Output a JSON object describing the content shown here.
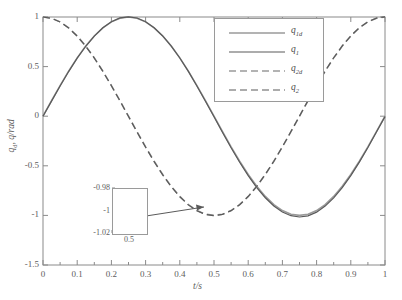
{
  "chart_data": {
    "type": "line",
    "title": "",
    "xlabel": "t/s",
    "ylabel": "q_d, q/rad",
    "xlim": [
      0,
      1
    ],
    "ylim": [
      -1.5,
      1
    ],
    "xticks": [
      "0",
      "0.1",
      "0.2",
      "0.3",
      "0.4",
      "0.5",
      "0.6",
      "0.7",
      "0.8",
      "0.9",
      "1"
    ],
    "xtick_values": [
      0,
      0.1,
      0.2,
      0.3,
      0.4,
      0.5,
      0.6,
      0.7,
      0.8,
      0.9,
      1
    ],
    "yticks": [
      "1",
      "0.5",
      "0",
      "-0.5",
      "-1",
      "-1.5"
    ],
    "ytick_values": [
      1,
      0.5,
      0,
      -0.5,
      -1,
      -1.5
    ],
    "grid": false,
    "legend_position": "upper-right",
    "series": [
      {
        "name": "q_1d",
        "label_main": "q",
        "label_sub": "1d",
        "style": "solid",
        "color": "#9a9a9a",
        "width": 1.6,
        "x": [
          0,
          0.025,
          0.05,
          0.075,
          0.1,
          0.125,
          0.15,
          0.175,
          0.2,
          0.225,
          0.25,
          0.275,
          0.3,
          0.325,
          0.35,
          0.375,
          0.4,
          0.425,
          0.45,
          0.475,
          0.5,
          0.525,
          0.55,
          0.575,
          0.6,
          0.625,
          0.65,
          0.675,
          0.7,
          0.725,
          0.75,
          0.775,
          0.8,
          0.825,
          0.85,
          0.875,
          0.9,
          0.925,
          0.95,
          0.975,
          1
        ],
        "values": [
          0,
          0.156,
          0.309,
          0.454,
          0.588,
          0.707,
          0.809,
          0.891,
          0.951,
          0.988,
          1,
          0.988,
          0.951,
          0.891,
          0.809,
          0.707,
          0.588,
          0.454,
          0.309,
          0.156,
          0,
          -0.156,
          -0.309,
          -0.454,
          -0.588,
          -0.707,
          -0.809,
          -0.891,
          -0.951,
          -0.988,
          -1,
          -0.988,
          -0.951,
          -0.891,
          -0.809,
          -0.707,
          -0.588,
          -0.454,
          -0.309,
          -0.156,
          0
        ]
      },
      {
        "name": "q_1",
        "label_main": "q",
        "label_sub": "1",
        "style": "solid",
        "color": "#5a5a5a",
        "width": 1.2,
        "x": [
          0,
          0.025,
          0.05,
          0.075,
          0.1,
          0.125,
          0.15,
          0.175,
          0.2,
          0.225,
          0.25,
          0.275,
          0.3,
          0.325,
          0.35,
          0.375,
          0.4,
          0.425,
          0.45,
          0.475,
          0.5,
          0.525,
          0.55,
          0.575,
          0.6,
          0.625,
          0.65,
          0.675,
          0.7,
          0.725,
          0.75,
          0.775,
          0.8,
          0.825,
          0.85,
          0.875,
          0.9,
          0.925,
          0.95,
          0.975,
          1
        ],
        "values": [
          0,
          0.152,
          0.304,
          0.45,
          0.585,
          0.705,
          0.808,
          0.892,
          0.953,
          0.991,
          1.002,
          0.99,
          0.953,
          0.892,
          0.809,
          0.707,
          0.587,
          0.452,
          0.305,
          0.151,
          -0.006,
          -0.164,
          -0.318,
          -0.464,
          -0.599,
          -0.719,
          -0.822,
          -0.905,
          -0.966,
          -1.003,
          -1.016,
          -1.004,
          -0.967,
          -0.906,
          -0.823,
          -0.72,
          -0.599,
          -0.463,
          -0.316,
          -0.16,
          -0.004
        ]
      },
      {
        "name": "q_2d",
        "label_main": "q",
        "label_sub": "2d",
        "style": "dashed",
        "color": "#9a9a9a",
        "width": 1.6,
        "x": [
          0,
          0.025,
          0.05,
          0.075,
          0.1,
          0.125,
          0.15,
          0.175,
          0.2,
          0.225,
          0.25,
          0.275,
          0.3,
          0.325,
          0.35,
          0.375,
          0.4,
          0.425,
          0.45,
          0.475,
          0.5,
          0.525,
          0.55,
          0.575,
          0.6,
          0.625,
          0.65,
          0.675,
          0.7,
          0.725,
          0.75,
          0.775,
          0.8,
          0.825,
          0.85,
          0.875,
          0.9,
          0.925,
          0.95,
          0.975,
          1
        ],
        "values": [
          1,
          0.988,
          0.951,
          0.891,
          0.809,
          0.707,
          0.588,
          0.454,
          0.309,
          0.156,
          0,
          -0.156,
          -0.309,
          -0.454,
          -0.588,
          -0.707,
          -0.809,
          -0.891,
          -0.951,
          -0.988,
          -1,
          -0.988,
          -0.951,
          -0.891,
          -0.809,
          -0.707,
          -0.588,
          -0.454,
          -0.309,
          -0.156,
          0,
          0.156,
          0.309,
          0.454,
          0.588,
          0.707,
          0.809,
          0.891,
          0.951,
          0.988,
          1
        ]
      },
      {
        "name": "q_2",
        "label_main": "q",
        "label_sub": "2",
        "style": "dashed",
        "color": "#5a5a5a",
        "width": 1.2,
        "x": [
          0,
          0.025,
          0.05,
          0.075,
          0.1,
          0.125,
          0.15,
          0.175,
          0.2,
          0.225,
          0.25,
          0.275,
          0.3,
          0.325,
          0.35,
          0.375,
          0.4,
          0.425,
          0.45,
          0.475,
          0.5,
          0.525,
          0.55,
          0.575,
          0.6,
          0.625,
          0.65,
          0.675,
          0.7,
          0.725,
          0.75,
          0.775,
          0.8,
          0.825,
          0.85,
          0.875,
          0.9,
          0.925,
          0.95,
          0.975,
          1
        ],
        "values": [
          1,
          0.986,
          0.949,
          0.889,
          0.807,
          0.705,
          0.586,
          0.452,
          0.307,
          0.154,
          -0.003,
          -0.16,
          -0.313,
          -0.458,
          -0.592,
          -0.711,
          -0.812,
          -0.894,
          -0.953,
          -0.99,
          -1.002,
          -0.99,
          -0.952,
          -0.892,
          -0.81,
          -0.707,
          -0.588,
          -0.454,
          -0.308,
          -0.155,
          0.001,
          0.157,
          0.31,
          0.455,
          0.589,
          0.708,
          0.81,
          0.892,
          0.952,
          0.989,
          1.001
        ]
      }
    ],
    "inset": {
      "xticks": [
        "0.5"
      ],
      "yticks": [
        "-0.98",
        "-1",
        "-1.02"
      ],
      "xlim": [
        0.49,
        0.51
      ],
      "ylim": [
        -1.02,
        -0.98
      ],
      "annotation": "zoom-of-q2-minimum"
    }
  },
  "axis": {
    "x_label": "t/s",
    "y_label_q": "q",
    "y_label_sub": "d",
    "y_label_rest": ", q/rad"
  }
}
